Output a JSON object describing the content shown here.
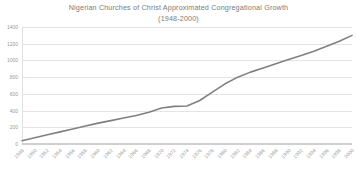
{
  "chart_data": {
    "type": "line",
    "title": "Nigerian Churches of Christ Approximated Congregational Growth",
    "subtitle": "(1948-2000)",
    "xlabel": "",
    "ylabel": "",
    "grid": true,
    "legend": false,
    "line_color": "#808080",
    "grid_color": "#e4e4e4",
    "ylim": [
      0,
      1400
    ],
    "yticks": [
      0,
      200,
      400,
      600,
      800,
      1000,
      1200,
      1400
    ],
    "ytick_labels": [
      "0",
      "200",
      "400",
      "600",
      "800",
      "1000",
      "1200",
      "1400"
    ],
    "categories": [
      "1948",
      "1950",
      "1952",
      "1954",
      "1956",
      "1958",
      "1960",
      "1962",
      "1964",
      "1966",
      "1968",
      "1970",
      "1972",
      "1974",
      "1976",
      "1978",
      "1980",
      "1982",
      "1984",
      "1986",
      "1988",
      "1990",
      "1992",
      "1994",
      "1996",
      "1998",
      "2000"
    ],
    "series": [
      {
        "name": "Congregations",
        "values": [
          40,
          75,
          110,
          145,
          180,
          215,
          250,
          280,
          310,
          340,
          380,
          430,
          450,
          455,
          520,
          620,
          720,
          800,
          860,
          910,
          960,
          1010,
          1060,
          1110,
          1170,
          1230,
          1300
        ]
      }
    ]
  }
}
